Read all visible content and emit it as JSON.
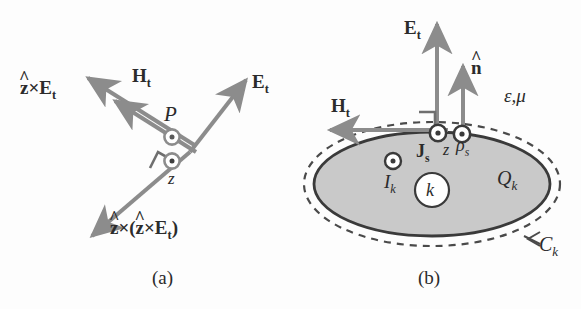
{
  "figure": {
    "panels": [
      {
        "id": "a",
        "caption": "(a)",
        "vectors": [
          {
            "name": "z-cross-Et",
            "label_plain": "ẑ×E_t",
            "direction": "upper-left",
            "style": "arrow"
          },
          {
            "name": "Ht",
            "label_plain": "H_t",
            "direction": "upper-left",
            "style": "arrow"
          },
          {
            "name": "Et",
            "label_plain": "E_t",
            "direction": "upper-right",
            "style": "arrow"
          },
          {
            "name": "z-cross-z-cross-Et",
            "label_plain": "ẑ×(ẑ×E_t)",
            "direction": "lower-left",
            "style": "arrow"
          }
        ],
        "point_symbols": [
          {
            "name": "poynting",
            "label_plain": "P",
            "glyph": "circled-dot"
          },
          {
            "name": "z-axis",
            "label_plain": "z",
            "glyph": "circled-dot"
          }
        ],
        "markers": [
          "right-angle"
        ],
        "labels": {
          "z_cross_Et": {
            "hat": "^",
            "zhat": "z",
            "times": "×",
            "E": "E",
            "sub": "t"
          },
          "Ht": {
            "H": "H",
            "sub": "t"
          },
          "Et": {
            "E": "E",
            "sub": "t"
          },
          "z_cross_z_cross_Et": {
            "open": "(",
            "close": ")",
            "times": "×",
            "zhat": "z",
            "E": "E",
            "sub": "t"
          },
          "P": "P",
          "z": "z"
        }
      },
      {
        "id": "b",
        "caption": "(b)",
        "vectors": [
          {
            "name": "Et",
            "label_plain": "E_t",
            "direction": "up",
            "style": "arrow"
          },
          {
            "name": "n-hat",
            "label_plain": "n̂",
            "direction": "up",
            "style": "arrow"
          },
          {
            "name": "Ht",
            "label_plain": "H_t",
            "direction": "left",
            "style": "arrow"
          }
        ],
        "point_symbols": [
          {
            "name": "surface-current",
            "label_plain": "J_s",
            "glyph": "circled-dot"
          },
          {
            "name": "z-axis",
            "label_plain": "z",
            "glyph": "none"
          },
          {
            "name": "surface-charge",
            "label_plain": "ρ_s",
            "glyph": "circled-dot"
          },
          {
            "name": "current-Ik",
            "label_plain": "I_k",
            "glyph": "circled-dot"
          }
        ],
        "region": {
          "name": "conductor-k",
          "interior_label": "k",
          "charge_label_plain": "Q_k",
          "contour_label_plain": "C_k",
          "medium_label_plain": "ε,μ",
          "fill_color": "#c9c9c9",
          "edge_color": "#3a3a3a",
          "contour_style": "dashed"
        },
        "markers": [
          "right-angle"
        ],
        "labels": {
          "Et": {
            "E": "E",
            "sub": "t"
          },
          "nhat": {
            "hat": "^",
            "n": "n"
          },
          "Ht": {
            "H": "H",
            "sub": "t"
          },
          "Js": {
            "J": "J",
            "sub": "s"
          },
          "z": "z",
          "rho_s": {
            "rho": "ρ",
            "sub": "s"
          },
          "Ik": {
            "I": "I",
            "sub": "k"
          },
          "k": "k",
          "Qk": {
            "Q": "Q",
            "sub": "k"
          },
          "Ck": {
            "C": "C",
            "sub": "k"
          },
          "eps_mu": "ε,μ"
        }
      }
    ],
    "colors": {
      "arrow": "#8c8c8c",
      "text": "#2b2b2b",
      "region_fill": "#c9c9c9",
      "region_edge": "#3a3a3a",
      "background": "#fdfdfd"
    }
  }
}
